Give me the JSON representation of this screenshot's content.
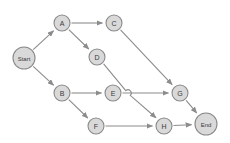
{
  "diagram": {
    "type": "flow-graph",
    "canvas": {
      "width": 230,
      "height": 143
    },
    "style": {
      "node_fill": "#d9d9d9",
      "node_stroke": "#8a8a8a",
      "edge_stroke": "#8c8c8c",
      "label_color": "#3a3a3a",
      "background": "#ffffff",
      "node_radius": 8,
      "terminal_radius": 11
    },
    "nodes": [
      {
        "id": "start",
        "label": "Start",
        "x": 24,
        "y": 58,
        "r": 11,
        "terminal": true
      },
      {
        "id": "a",
        "label": "A",
        "x": 62,
        "y": 23,
        "r": 8,
        "terminal": false
      },
      {
        "id": "c",
        "label": "C",
        "x": 114,
        "y": 23,
        "r": 8,
        "terminal": false
      },
      {
        "id": "d",
        "label": "D",
        "x": 97,
        "y": 57,
        "r": 8,
        "terminal": false
      },
      {
        "id": "b",
        "label": "B",
        "x": 62,
        "y": 93,
        "r": 8,
        "terminal": false
      },
      {
        "id": "e",
        "label": "E",
        "x": 113,
        "y": 93,
        "r": 8,
        "terminal": false
      },
      {
        "id": "f",
        "label": "F",
        "x": 96,
        "y": 126,
        "r": 8,
        "terminal": false
      },
      {
        "id": "g",
        "label": "G",
        "x": 180,
        "y": 93,
        "r": 8,
        "terminal": false
      },
      {
        "id": "h",
        "label": "H",
        "x": 164,
        "y": 126,
        "r": 8,
        "terminal": false
      },
      {
        "id": "end",
        "label": "End",
        "x": 206,
        "y": 124,
        "r": 11,
        "terminal": true
      }
    ],
    "edges": [
      {
        "id": "start-a",
        "from": "start",
        "to": "a",
        "directed": true
      },
      {
        "id": "start-b",
        "from": "start",
        "to": "b",
        "directed": true
      },
      {
        "id": "a-c",
        "from": "a",
        "to": "c",
        "directed": true
      },
      {
        "id": "a-d",
        "from": "a",
        "to": "d",
        "directed": true
      },
      {
        "id": "c-g",
        "from": "c",
        "to": "g",
        "directed": true
      },
      {
        "id": "d-h",
        "from": "d",
        "to": "h",
        "directed": true,
        "hop_at": {
          "x": 128,
          "y": 93
        }
      },
      {
        "id": "b-e",
        "from": "b",
        "to": "e",
        "directed": true
      },
      {
        "id": "b-f",
        "from": "b",
        "to": "f",
        "directed": true
      },
      {
        "id": "e-g",
        "from": "e",
        "to": "g",
        "directed": true
      },
      {
        "id": "f-h",
        "from": "f",
        "to": "h",
        "directed": true
      },
      {
        "id": "g-end",
        "from": "g",
        "to": "end",
        "directed": true
      },
      {
        "id": "h-end",
        "from": "h",
        "to": "end",
        "directed": true
      }
    ]
  }
}
